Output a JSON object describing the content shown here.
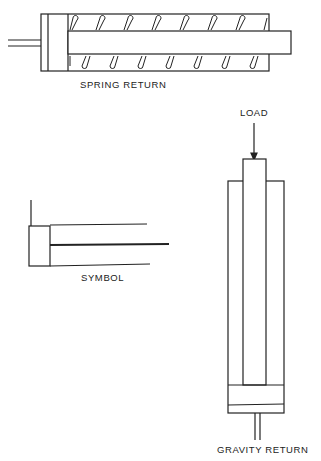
{
  "figures": {
    "spring_return": {
      "label": "SPRING RETURN"
    },
    "symbol": {
      "label": "SYMBOL"
    },
    "gravity_return": {
      "label": "GRAVITY RETURN",
      "load_label": "LOAD"
    }
  },
  "colors": {
    "stroke": "#222222",
    "background": "#ffffff"
  }
}
